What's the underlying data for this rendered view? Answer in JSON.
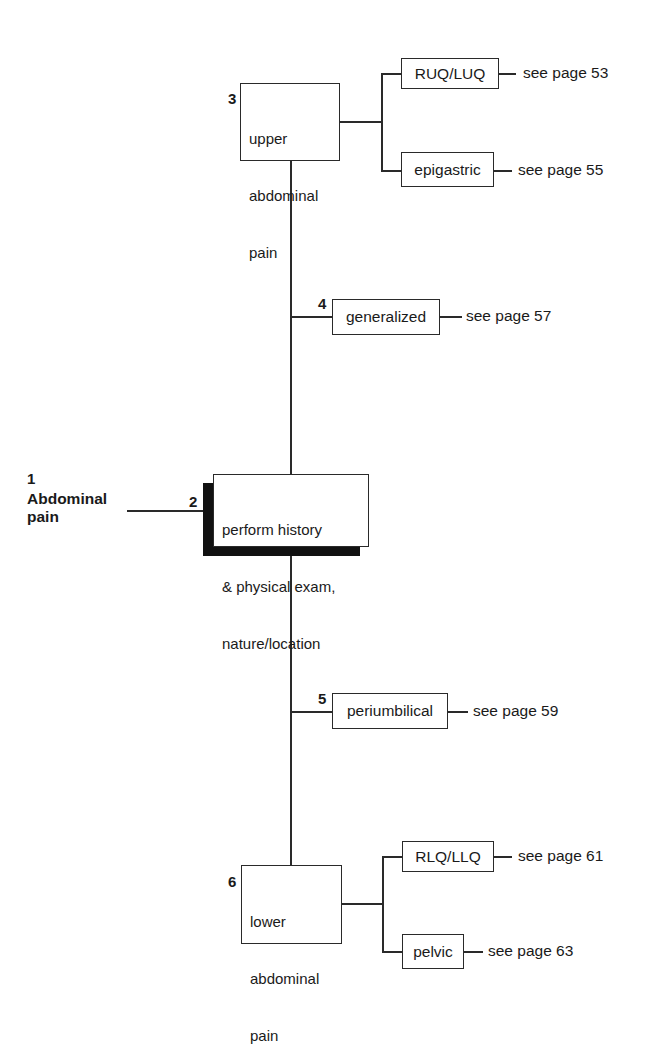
{
  "diagram": {
    "type": "flowchart",
    "title": "Abdominal pain",
    "root": {
      "number": "1",
      "label_line1": "Abdominal",
      "label_line2": "pain"
    },
    "step2": {
      "number": "2",
      "line1": "perform history",
      "line2": "& physical exam,",
      "line3": "nature/location"
    },
    "step3": {
      "number": "3",
      "line1": "upper",
      "line2": "abdominal",
      "line3": "pain",
      "branches": [
        {
          "label": "RUQ/LUQ",
          "ref": "see page 53"
        },
        {
          "label": "epigastric",
          "ref": "see page 55"
        }
      ]
    },
    "step4": {
      "number": "4",
      "label": "generalized",
      "ref": "see page 57"
    },
    "step5": {
      "number": "5",
      "label": "periumbilical",
      "ref": "see page 59"
    },
    "step6": {
      "number": "6",
      "line1": "lower",
      "line2": "abdominal",
      "line3": "pain",
      "branches": [
        {
          "label": "RLQ/LLQ",
          "ref": "see page 61"
        },
        {
          "label": "pelvic",
          "ref": "see page 63"
        }
      ]
    },
    "colors": {
      "line": "#2a2a2a",
      "shadow": "#111111",
      "background": "#ffffff"
    }
  }
}
